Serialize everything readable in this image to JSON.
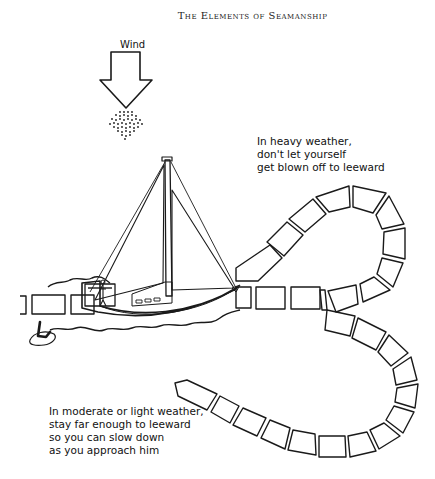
{
  "header": {
    "title": "The Elements of Seamanship"
  },
  "wind": {
    "label": "Wind",
    "icon": "down-arrow-icon"
  },
  "captions": {
    "heavy_weather": [
      "In heavy weather,",
      "don't let yourself",
      "get blown off to leeward"
    ],
    "light_weather": [
      "In moderate or light weather,",
      "stay far enough to leeward",
      "so you can slow down",
      "as you approach him"
    ]
  },
  "illustration": {
    "subjects": [
      "sailboat",
      "person-overboard",
      "wake-path-heavy",
      "wake-path-light"
    ],
    "stroke_color": "#1a1a1a",
    "background": "#ffffff"
  }
}
